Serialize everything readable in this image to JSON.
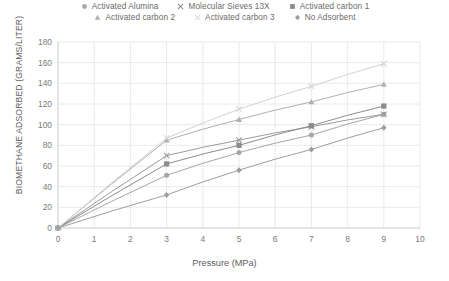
{
  "chart_data": {
    "type": "scatter",
    "title": "",
    "xlabel": "Pressure (MPa)",
    "ylabel": "BIOMETHANE ADSORBED (GRAMS/LITER)",
    "xlim": [
      0,
      10
    ],
    "ylim": [
      0,
      180
    ],
    "xticks": [
      "0",
      "1",
      "2",
      "3",
      "4",
      "5",
      "6",
      "7",
      "8",
      "9",
      "10"
    ],
    "yticks": [
      "0",
      "20",
      "40",
      "60",
      "80",
      "100",
      "120",
      "140",
      "160",
      "180"
    ],
    "grid": true,
    "legend_position": "top",
    "x": [
      0,
      3,
      5,
      7,
      9
    ],
    "series": [
      {
        "name": "Activated Alumina",
        "marker": "circle",
        "color": "#a6a6a6",
        "values": [
          0,
          51,
          73,
          90,
          110
        ]
      },
      {
        "name": "Molecular Sieves 13X",
        "marker": "cross",
        "color": "#9b9b9b",
        "values": [
          0,
          70,
          85,
          98,
          110
        ]
      },
      {
        "name": "Activated carbon 1",
        "marker": "square",
        "color": "#8c8c8c",
        "values": [
          0,
          62,
          80,
          99,
          118
        ]
      },
      {
        "name": "Activated carbon 2",
        "marker": "triangle",
        "color": "#b0b0b0",
        "values": [
          0,
          85,
          105,
          122,
          139
        ]
      },
      {
        "name": "Activated carbon 3",
        "marker": "cross-light",
        "color": "#d2d2d2",
        "values": [
          0,
          87,
          115,
          137,
          159
        ]
      },
      {
        "name": "No Adsorbent",
        "marker": "diamond",
        "color": "#9e9e9e",
        "values": [
          0,
          32,
          56,
          76,
          97
        ]
      }
    ]
  },
  "legend": {
    "rows": [
      [
        {
          "label": "Activated Alumina",
          "marker": "circle-icon"
        },
        {
          "label": "Molecular Sieves 13X",
          "marker": "cross-icon"
        },
        {
          "label": "Activated carbon 1",
          "marker": "square-icon"
        }
      ],
      [
        {
          "label": "Activated carbon 2",
          "marker": "triangle-icon"
        },
        {
          "label": "Activated carbon 3",
          "marker": "cross-light-icon"
        },
        {
          "label": "No Adsorbent",
          "marker": "diamond-icon"
        }
      ]
    ]
  }
}
